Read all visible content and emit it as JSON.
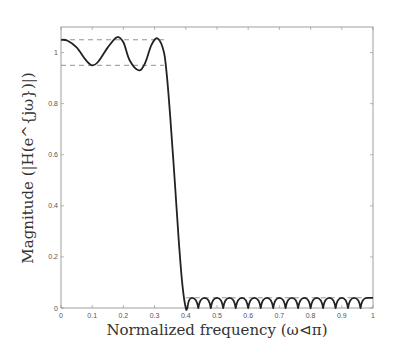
{
  "chart_data": {
    "type": "line",
    "title": "",
    "xlabel": "Normalized frequency (ω⊲π)",
    "ylabel": "Magnitude (|H(e^{jω})|)",
    "xlim": [
      0,
      1
    ],
    "ylim": [
      0,
      1.1
    ],
    "grid": false,
    "legend": null,
    "x_ticks": [
      "0",
      "0.1",
      "0.2",
      "0.3",
      "0.4",
      "0.5",
      "0.6",
      "0.7",
      "0.8",
      "0.9",
      "1"
    ],
    "y_ticks": [
      "0",
      "0.2",
      "0.4",
      "0.6",
      "0.8",
      "1"
    ],
    "series": [
      {
        "name": "magnitude response",
        "style": "solid",
        "color": "#222222",
        "x": [
          0,
          0.02,
          0.05,
          0.08,
          0.1,
          0.12,
          0.15,
          0.18,
          0.2,
          0.22,
          0.25,
          0.27,
          0.29,
          0.31,
          0.33,
          0.34,
          0.35,
          0.36,
          0.37,
          0.38,
          0.39,
          0.4,
          0.405,
          0.42,
          0.44,
          0.46,
          0.48,
          0.5,
          0.52,
          0.54,
          0.56,
          0.58,
          0.6,
          0.62,
          0.64,
          0.66,
          0.68,
          0.7,
          0.72,
          0.74,
          0.76,
          0.78,
          0.8,
          0.82,
          0.84,
          0.86,
          0.88,
          0.9,
          0.92,
          0.94,
          0.96,
          0.98,
          1.0
        ],
        "y": [
          1.05,
          1.047,
          1.02,
          0.97,
          0.95,
          0.965,
          1.02,
          1.06,
          1.04,
          0.97,
          0.93,
          0.96,
          1.03,
          1.055,
          1.0,
          0.9,
          0.75,
          0.58,
          0.4,
          0.22,
          0.08,
          0.0,
          0.0,
          0.04,
          0.0,
          0.04,
          0.0,
          0.04,
          0.0,
          0.04,
          0.0,
          0.04,
          0.0,
          0.04,
          0.0,
          0.04,
          0.0,
          0.04,
          0.0,
          0.04,
          0.0,
          0.04,
          0.0,
          0.04,
          0.0,
          0.04,
          0.0,
          0.04,
          0.0,
          0.04,
          0.0,
          0.04,
          0.04
        ]
      }
    ],
    "annotations": [
      {
        "type": "hline",
        "style": "dashed",
        "y": 1.05,
        "x_range": [
          0,
          0.33
        ],
        "label": "passband upper bound"
      },
      {
        "type": "hline",
        "style": "dashed",
        "y": 0.95,
        "x_range": [
          0,
          0.33
        ],
        "label": "passband lower bound"
      },
      {
        "type": "hline",
        "style": "dashed",
        "y": 0.04,
        "x_range": [
          0.4,
          1.0
        ],
        "label": "stopband bound"
      }
    ]
  }
}
